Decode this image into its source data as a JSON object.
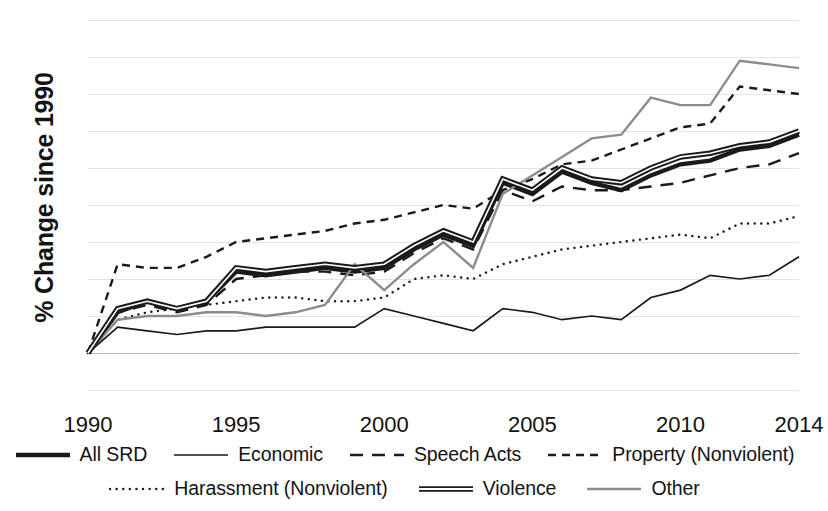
{
  "chart_data": {
    "type": "line",
    "title": "",
    "xlabel": "",
    "ylabel": "% Change since 1990",
    "x": [
      1990,
      1991,
      1992,
      1993,
      1994,
      1995,
      1996,
      1997,
      1998,
      1999,
      2000,
      2001,
      2002,
      2003,
      2004,
      2005,
      2006,
      2007,
      2008,
      2009,
      2010,
      2011,
      2012,
      2013,
      2014
    ],
    "xticks": [
      "1990",
      "1995",
      "2000",
      "2005",
      "2010",
      "2014"
    ],
    "xtick_values": [
      1990,
      1995,
      2000,
      2005,
      2010,
      2014
    ],
    "yticks": [
      "-10",
      "0",
      "10",
      "20",
      "30",
      "40",
      "50",
      "60",
      "70",
      "80",
      "90"
    ],
    "ytick_values": [
      -10,
      0,
      10,
      20,
      30,
      40,
      50,
      60,
      70,
      80,
      90
    ],
    "xlim": [
      1990,
      2014
    ],
    "ylim": [
      -10,
      90
    ],
    "grid": true,
    "legend_position": "bottom",
    "series": [
      {
        "name": "All SRD",
        "style": "solid",
        "width": "thick",
        "color": "#1a1a1a",
        "values": [
          0,
          11,
          14,
          12,
          14,
          22,
          21,
          22,
          23,
          22,
          23,
          28,
          32,
          29,
          46,
          43,
          49,
          46,
          44,
          48,
          51,
          52,
          55,
          56,
          59
        ]
      },
      {
        "name": "Economic",
        "style": "solid",
        "width": "thin",
        "color": "#1a1a1a",
        "values": [
          0,
          7,
          6,
          5,
          6,
          6,
          7,
          7,
          7,
          7,
          12,
          10,
          8,
          6,
          12,
          11,
          9,
          10,
          9,
          15,
          17,
          21,
          20,
          21,
          26
        ]
      },
      {
        "name": "Speech Acts",
        "style": "dashed-long",
        "width": "medium",
        "color": "#1a1a1a",
        "values": [
          0,
          11,
          13,
          11,
          13,
          20,
          21,
          22,
          22,
          21,
          22,
          27,
          31,
          28,
          44,
          41,
          45,
          44,
          44,
          45,
          46,
          48,
          50,
          51,
          54
        ]
      },
      {
        "name": "Property (Nonviolent)",
        "style": "dashed-short",
        "width": "medium",
        "color": "#1a1a1a",
        "values": [
          0,
          24,
          23,
          23,
          26,
          30,
          31,
          32,
          33,
          35,
          36,
          38,
          40,
          39,
          44,
          47,
          51,
          52,
          55,
          58,
          61,
          62,
          72,
          71,
          70
        ]
      },
      {
        "name": "Harassment (Nonviolent)",
        "style": "dotted",
        "width": "medium",
        "color": "#1a1a1a",
        "values": [
          0,
          9,
          11,
          12,
          13,
          14,
          15,
          15,
          14,
          14,
          15,
          20,
          21,
          20,
          24,
          26,
          28,
          29,
          30,
          31,
          32,
          31,
          35,
          35,
          37
        ]
      },
      {
        "name": "Violence",
        "style": "solid",
        "width": "thick-double",
        "color": "#1a1a1a",
        "values": [
          0,
          12,
          14,
          12,
          14,
          23,
          22,
          23,
          24,
          23,
          24,
          29,
          33,
          30,
          47,
          44,
          50,
          47,
          46,
          50,
          53,
          54,
          56,
          57,
          60
        ]
      },
      {
        "name": "Other",
        "style": "solid",
        "width": "medium",
        "color": "#8c8c8c",
        "values": [
          0,
          9,
          10,
          10,
          11,
          11,
          10,
          11,
          13,
          24,
          17,
          24,
          30,
          23,
          43,
          48,
          53,
          58,
          59,
          69,
          67,
          67,
          79,
          78,
          77
        ]
      }
    ]
  },
  "legend": {
    "row1": [
      {
        "label": "All SRD",
        "key": "all-srd"
      },
      {
        "label": "Economic",
        "key": "economic"
      },
      {
        "label": "Speech Acts",
        "key": "speech-acts"
      },
      {
        "label": "Property (Nonviolent)",
        "key": "property-nonviolent"
      }
    ],
    "row2": [
      {
        "label": "Harassment (Nonviolent)",
        "key": "harassment-nonviolent"
      },
      {
        "label": "Violence",
        "key": "violence"
      },
      {
        "label": "Other",
        "key": "other"
      }
    ]
  }
}
